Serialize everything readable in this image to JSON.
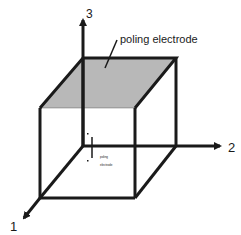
{
  "diagram": {
    "title": "",
    "labels": {
      "axis_3": "3",
      "axis_2": "2",
      "axis_1": "1",
      "electrode": "poling electrode",
      "inner_label_line1": "poling",
      "inner_label_line2": "electrode"
    },
    "colors": {
      "stroke": "#1a1a1a",
      "electrode_fill": "#b8b8b8",
      "background": "#ffffff"
    },
    "shape": "cube",
    "axes": [
      "1",
      "2",
      "3"
    ]
  }
}
